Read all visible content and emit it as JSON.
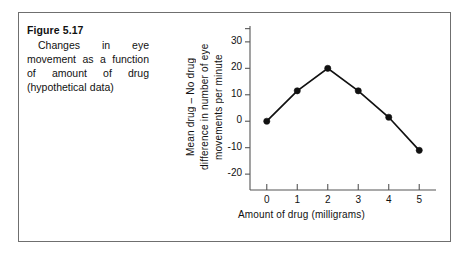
{
  "figure": {
    "caption_title": "Figure 5.17",
    "caption_body": "Changes in eye movement as a function of amount of drug (hypothetical data)"
  },
  "chart_data": {
    "type": "line",
    "title": "",
    "xlabel": "Amount of drug (milligrams)",
    "ylabel": "Mean drug – No drug difference in number of eye movements per minute",
    "ylabel_lines": [
      "Mean drug – No drug",
      "difference in number of eye",
      "movements  per  minute"
    ],
    "x": [
      0,
      1,
      2,
      3,
      4,
      5
    ],
    "values": [
      0,
      11.5,
      20,
      11.5,
      1.5,
      -11
    ],
    "xtick_labels": [
      "0",
      "1",
      "2",
      "3",
      "4",
      "5"
    ],
    "ytick_labels": [
      "30",
      "20",
      "10",
      "0",
      "-10",
      "-20"
    ],
    "ytick_values": [
      30,
      20,
      10,
      0,
      -10,
      -20
    ],
    "xlim": [
      -0.55,
      5.55
    ],
    "ylim": [
      -26,
      36
    ],
    "grid": false,
    "legend": false,
    "marker": "filled-circle",
    "line_color": "#111111",
    "marker_color": "#111111",
    "axis_color": "#555555",
    "frame_color": "#6f6f6f",
    "background": "#ffffff"
  }
}
